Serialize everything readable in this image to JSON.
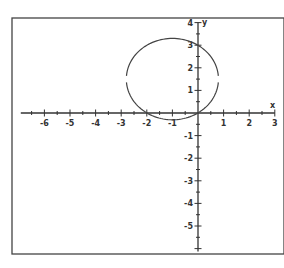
{
  "chart_data": {
    "type": "line",
    "title": "",
    "xlabel": "x",
    "ylabel": "y",
    "xlim": [
      -7,
      3
    ],
    "ylim": [
      -6,
      4
    ],
    "grid": false,
    "x_ticks": [
      -6,
      -5,
      -4,
      -3,
      -2,
      -1,
      1,
      2,
      3
    ],
    "y_ticks": [
      4,
      3,
      2,
      1,
      -1,
      -2,
      -3,
      -4,
      -5
    ],
    "minor_ticks_per_unit": 2,
    "series": [
      {
        "name": "circle",
        "equation": "(x+1)^2 + (y-1.5)^2 = 3.25",
        "center": [
          -1,
          1.5
        ],
        "radius": 1.8,
        "notable_points": [
          [
            0,
            0
          ],
          [
            -2,
            0
          ],
          [
            0,
            3
          ]
        ],
        "gaps_at_y": 1.5
      }
    ]
  }
}
